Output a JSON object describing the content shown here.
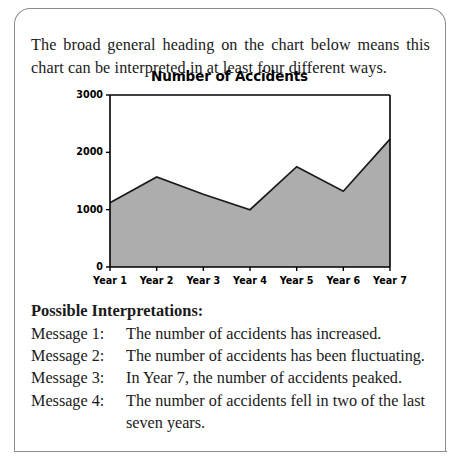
{
  "panel": {
    "intro_text": "The broad general heading on the chart below means this chart can be interpreted in at least four different ways."
  },
  "chart_data": {
    "type": "area",
    "title": "Number of Accidents",
    "xlabel": "",
    "ylabel": "",
    "categories": [
      "Year 1",
      "Year 2",
      "Year 3",
      "Year 4",
      "Year 5",
      "Year 6",
      "Year 7"
    ],
    "values": [
      1120,
      1570,
      1270,
      1000,
      1750,
      1320,
      2230
    ],
    "ylim": [
      0,
      3000
    ],
    "yticks": [
      0,
      1000,
      2000,
      3000
    ],
    "ytick_labels": [
      "0",
      "1000",
      "2000",
      "3000"
    ],
    "grid": false,
    "legend": null,
    "fill_color": "#adadad",
    "line_color": "#1a1a1a",
    "axis_color": "#000000"
  },
  "interpretations": {
    "heading": "Possible Interpretations:",
    "items": [
      {
        "label": "Message 1:",
        "text": "The number of accidents has increased.",
        "continuation": ""
      },
      {
        "label": "Message 2:",
        "text": "The number of accidents has been fluctuating.",
        "continuation": ""
      },
      {
        "label": "Message 3:",
        "text": "In Year 7, the number of accidents peaked.",
        "continuation": ""
      },
      {
        "label": "Message 4:",
        "text": "The number of accidents fell in two of the last",
        "continuation": "seven years."
      }
    ]
  }
}
